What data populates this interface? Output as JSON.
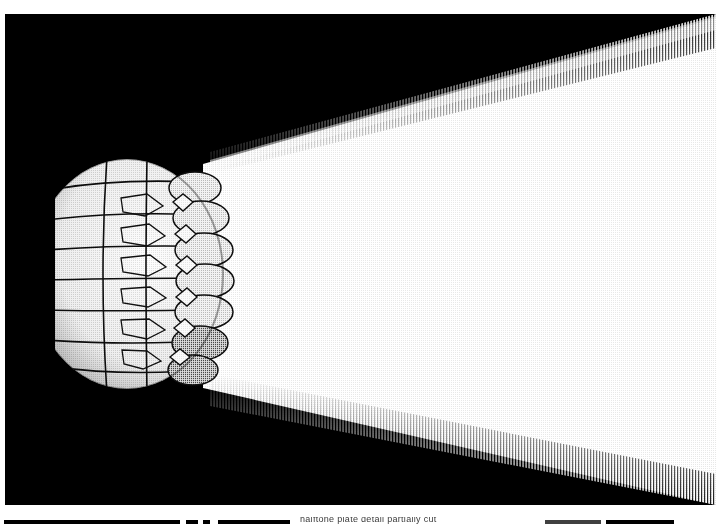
{
  "document": {
    "kind": "scanned-halftone-photograph",
    "page_background": "#ffffff",
    "plate_background": "#000000",
    "highlight_color": "#ffffff",
    "ink_color": "#000000"
  },
  "plate": {
    "name": "illuminated-dome-optic-plate",
    "left": 5,
    "top": 14,
    "width": 711,
    "height": 491,
    "description": "Halftone photograph of a domed multi-panel lens optic projecting a broad wedge of light to the right across a black field"
  },
  "beam": {
    "name": "light-beam",
    "origin_x": 210,
    "origin_top_y": 152,
    "origin_bottom_y": 376,
    "far_top_y": 18,
    "far_bottom_y": 492,
    "far_x": 711,
    "fill": "#ffffff",
    "edge_treatment": "dithered-halftone-gradient"
  },
  "optic": {
    "name": "dome-lens-assembly",
    "center_x": 120,
    "center_y": 260,
    "radius_x": 95,
    "radius_y": 115,
    "panel_rows": 7,
    "panel_columns": 4,
    "petal_count": 5,
    "surface_tone": "#ededed",
    "seam_color": "#0a0a0a",
    "description": "Hemispherical array of rounded lens segments with interstitial diamond panes and finger-like petal elements projecting left"
  },
  "caption_strip": {
    "name": "cropped-caption-strip",
    "top": 514,
    "height": 15,
    "note": "Lower caption row clipped by the screenshot edge; only the upper fragments of rules and glyphs are visible",
    "clipped_text": "halftone plate detail partially cut",
    "bars": [
      {
        "label": "rule-left",
        "x": 4,
        "width": 176
      },
      {
        "label": "rule-tick-a",
        "x": 186,
        "width": 12
      },
      {
        "label": "rule-tick-b",
        "x": 203,
        "width": 7
      },
      {
        "label": "rule-mid",
        "x": 218,
        "width": 72
      },
      {
        "label": "rule-right-grey",
        "x": 545,
        "width": 56
      },
      {
        "label": "rule-right",
        "x": 606,
        "width": 68
      }
    ]
  }
}
